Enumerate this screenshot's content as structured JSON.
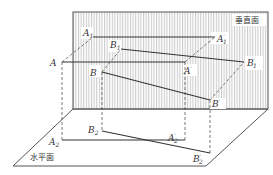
{
  "diagram": {
    "type": "orthographic-projection",
    "planes": {
      "vertical": {
        "label": "垂直面",
        "corners": [
          [
            73,
            12
          ],
          [
            268,
            12
          ],
          [
            268,
            109
          ],
          [
            73,
            109
          ]
        ],
        "fill": "hatched-vertical"
      },
      "horizontal": {
        "label": "水平面",
        "corners": [
          [
            73,
            109
          ],
          [
            268,
            109
          ],
          [
            206,
            166
          ],
          [
            13,
            166
          ]
        ]
      }
    },
    "points": {
      "A": {
        "label": "A",
        "sub": "",
        "prime": false,
        "x": 62,
        "y": 62
      },
      "B": {
        "label": "B",
        "sub": "",
        "prime": false,
        "x": 102,
        "y": 72
      },
      "A1": {
        "label": "A",
        "sub": "1",
        "prime": false,
        "x": 93,
        "y": 37
      },
      "B1": {
        "label": "B",
        "sub": "1",
        "prime": false,
        "x": 121,
        "y": 49
      },
      "A'": {
        "label": "A",
        "sub": "",
        "prime": true,
        "x": 185,
        "y": 62
      },
      "B'": {
        "label": "B",
        "sub": "",
        "prime": true,
        "x": 210,
        "y": 100
      },
      "A1'": {
        "label": "A",
        "sub": "1",
        "prime": true,
        "x": 215,
        "y": 37
      },
      "B1'": {
        "label": "B",
        "sub": "1",
        "prime": true,
        "x": 244,
        "y": 62
      },
      "A2": {
        "label": "A",
        "sub": "2",
        "prime": false,
        "x": 62,
        "y": 140
      },
      "B2": {
        "label": "B",
        "sub": "2",
        "prime": false,
        "x": 102,
        "y": 131
      },
      "A2'": {
        "label": "A",
        "sub": "2",
        "prime": true,
        "x": 185,
        "y": 140
      },
      "B2'": {
        "label": "B",
        "sub": "2",
        "prime": true,
        "x": 210,
        "y": 153
      }
    },
    "solid_segments": [
      [
        "A",
        "A'"
      ],
      [
        "B",
        "B'"
      ],
      [
        "A1",
        "A1'"
      ],
      [
        "B1",
        "B1'"
      ],
      [
        "A2",
        "A2'"
      ],
      [
        "B2",
        "B2'"
      ]
    ],
    "dashed_segments": [
      [
        "A",
        "A1"
      ],
      [
        "B",
        "B1"
      ],
      [
        "A'",
        "A1'"
      ],
      [
        "B'",
        "B1'"
      ],
      [
        "A",
        "A2"
      ],
      [
        "B",
        "B2"
      ],
      [
        "A'",
        "A2'"
      ],
      [
        "B'",
        "B2'"
      ]
    ],
    "colors": {
      "line": "#333333",
      "hatch": "#9a9a9a",
      "plane_border": "#555555"
    }
  }
}
